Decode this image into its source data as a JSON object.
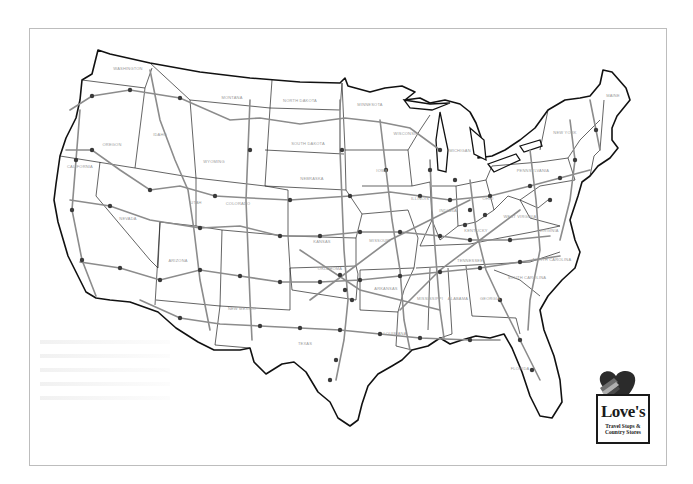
{
  "map": {
    "title": "Love's Travel Stops & Country Stores Locations",
    "region": "Continental United States",
    "colors": {
      "border": "#1a1a1a",
      "highway": "#8c8c8c",
      "marker": "#3a3a3a",
      "label": "#9a9a9a",
      "frame": "#bdbdbd"
    },
    "states": [
      {
        "name": "WASHINGTON",
        "x": 128,
        "y": 70
      },
      {
        "name": "OREGON",
        "x": 112,
        "y": 146
      },
      {
        "name": "CALIFORNIA",
        "x": 80,
        "y": 168
      },
      {
        "name": "NEVADA",
        "x": 128,
        "y": 220
      },
      {
        "name": "IDAHO",
        "x": 160,
        "y": 136
      },
      {
        "name": "MONTANA",
        "x": 232,
        "y": 99
      },
      {
        "name": "WYOMING",
        "x": 214,
        "y": 163
      },
      {
        "name": "UTAH",
        "x": 196,
        "y": 204
      },
      {
        "name": "ARIZONA",
        "x": 178,
        "y": 262
      },
      {
        "name": "COLORADO",
        "x": 238,
        "y": 205
      },
      {
        "name": "NEW MEXICO",
        "x": 242,
        "y": 310
      },
      {
        "name": "NORTH DAKOTA",
        "x": 300,
        "y": 102
      },
      {
        "name": "SOUTH DAKOTA",
        "x": 308,
        "y": 145
      },
      {
        "name": "NEBRASKA",
        "x": 312,
        "y": 180
      },
      {
        "name": "KANSAS",
        "x": 322,
        "y": 243
      },
      {
        "name": "OKLAHOMA",
        "x": 330,
        "y": 270
      },
      {
        "name": "TEXAS",
        "x": 305,
        "y": 345
      },
      {
        "name": "MINNESOTA",
        "x": 370,
        "y": 106
      },
      {
        "name": "IOWA",
        "x": 382,
        "y": 172
      },
      {
        "name": "MISSOURI",
        "x": 380,
        "y": 242
      },
      {
        "name": "ARKANSAS",
        "x": 386,
        "y": 290
      },
      {
        "name": "LOUISIANA",
        "x": 395,
        "y": 335
      },
      {
        "name": "WISCONSIN",
        "x": 406,
        "y": 135
      },
      {
        "name": "ILLINOIS",
        "x": 420,
        "y": 200
      },
      {
        "name": "MICHIGAN",
        "x": 460,
        "y": 152
      },
      {
        "name": "INDIANA",
        "x": 448,
        "y": 212
      },
      {
        "name": "OHIO",
        "x": 488,
        "y": 200
      },
      {
        "name": "KENTUCKY",
        "x": 476,
        "y": 232
      },
      {
        "name": "TENNESSEE",
        "x": 470,
        "y": 262
      },
      {
        "name": "MISSISSIPPI",
        "x": 430,
        "y": 300
      },
      {
        "name": "ALABAMA",
        "x": 458,
        "y": 300
      },
      {
        "name": "GEORGIA",
        "x": 490,
        "y": 300
      },
      {
        "name": "FLORIDA",
        "x": 520,
        "y": 370
      },
      {
        "name": "SOUTH CAROLINA",
        "x": 527,
        "y": 279
      },
      {
        "name": "NORTH CAROLINA",
        "x": 552,
        "y": 261
      },
      {
        "name": "VIRGINIA",
        "x": 549,
        "y": 232
      },
      {
        "name": "WEST VIRGINIA",
        "x": 520,
        "y": 218
      },
      {
        "name": "PENNSYLVANIA",
        "x": 533,
        "y": 172
      },
      {
        "name": "NEW YORK",
        "x": 565,
        "y": 134
      },
      {
        "name": "MAINE",
        "x": 613,
        "y": 97
      }
    ]
  },
  "logo": {
    "brand": "Love's",
    "tagline_line1": "Travel Stops &",
    "tagline_line2": "Country Stores",
    "heart_color": "#2b2b2b",
    "stripe_colors": [
      "#6d6d6d",
      "#b0b0b0",
      "#4a4a4a"
    ]
  }
}
